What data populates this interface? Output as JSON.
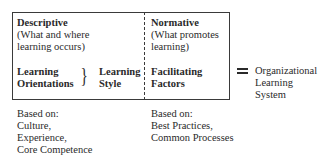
{
  "descriptive": {
    "title": "Descriptive",
    "subtitle_line1": "(What and where",
    "subtitle_line2": "learning occurs)",
    "left_line1": "Learning",
    "left_line2": "Orientations",
    "brace": "}",
    "right_line1": "Learning",
    "right_line2": "Style",
    "based_on_label": "Based on:",
    "based_on_items": [
      "Culture,",
      "Experience,",
      "Core Competence"
    ]
  },
  "normative": {
    "title": "Normative",
    "subtitle_line1": "(What promotes",
    "subtitle_line2": "learning)",
    "factors_line1": "Facilitating",
    "factors_line2": "Factors",
    "based_on_label": "Based on:",
    "based_on_items": [
      "Best Practices,",
      "Common Processes"
    ]
  },
  "result": {
    "equals_symbol": "=",
    "line1": "Organizational",
    "line2": "Learning",
    "line3": "System"
  }
}
